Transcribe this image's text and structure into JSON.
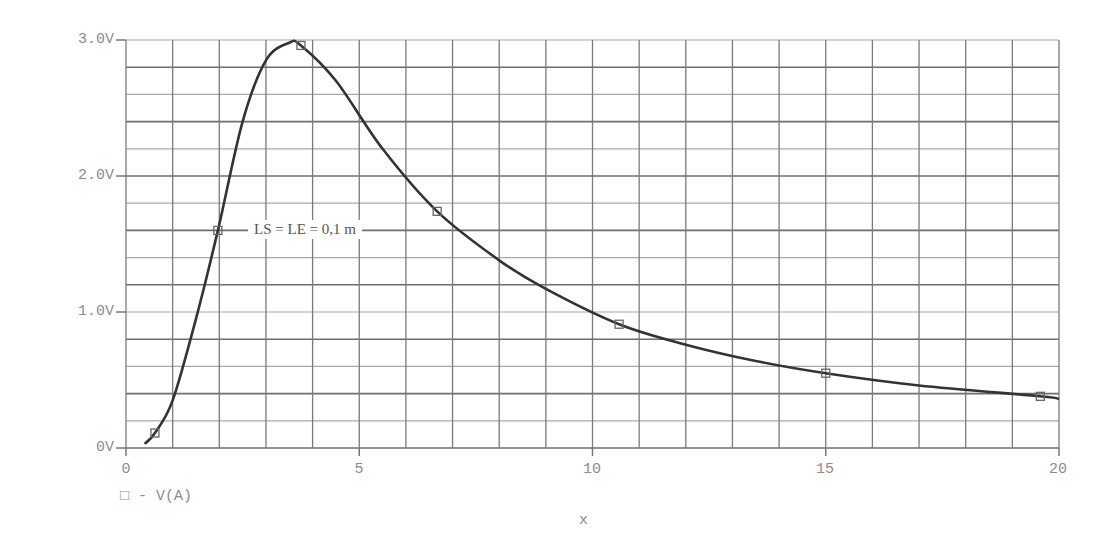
{
  "chart_data": {
    "type": "line",
    "title": "",
    "xlabel": "x",
    "ylabel": "",
    "xlim": [
      0,
      20
    ],
    "ylim": [
      0,
      3.0
    ],
    "grid": true,
    "x_ticks": [
      "0",
      "5",
      "10",
      "15",
      "20"
    ],
    "y_ticks": [
      "0V",
      "1.0V",
      "2.0V",
      "3.0V"
    ],
    "legend": {
      "position": "bottom-left",
      "entries": [
        "□ - V(A)"
      ]
    },
    "annotations": [
      {
        "text": "LS = LE = 0,1 m",
        "x": 2.5,
        "y": 1.55
      }
    ],
    "series": [
      {
        "name": "V(A)",
        "marker": "square",
        "x": [
          0.4,
          0.62,
          1.0,
          1.5,
          1.97,
          2.5,
          3.0,
          3.5,
          3.75,
          4.5,
          5.5,
          6.67,
          8.0,
          9.0,
          10.57,
          12.0,
          13.5,
          15.0,
          17.0,
          19.6,
          20.0
        ],
        "values": [
          0.03,
          0.11,
          0.35,
          0.95,
          1.6,
          2.4,
          2.85,
          2.98,
          2.96,
          2.7,
          2.2,
          1.74,
          1.38,
          1.17,
          0.91,
          0.76,
          0.64,
          0.55,
          0.46,
          0.38,
          0.36
        ]
      }
    ],
    "markers": [
      {
        "x": 0.62,
        "y": 0.11
      },
      {
        "x": 1.97,
        "y": 1.6
      },
      {
        "x": 3.75,
        "y": 2.96
      },
      {
        "x": 6.67,
        "y": 1.74
      },
      {
        "x": 10.57,
        "y": 0.91
      },
      {
        "x": 15.0,
        "y": 0.55
      },
      {
        "x": 19.6,
        "y": 0.38
      }
    ]
  },
  "labels": {
    "y0": "0V",
    "y1": "1.0V",
    "y2": "2.0V",
    "y3": "3.0V",
    "x0": "0",
    "x5": "5",
    "x10": "10",
    "x15": "15",
    "x20": "20",
    "xtitle": "x",
    "legend": "□ - V(A)",
    "annotation": "LS = LE = 0,1 m"
  }
}
